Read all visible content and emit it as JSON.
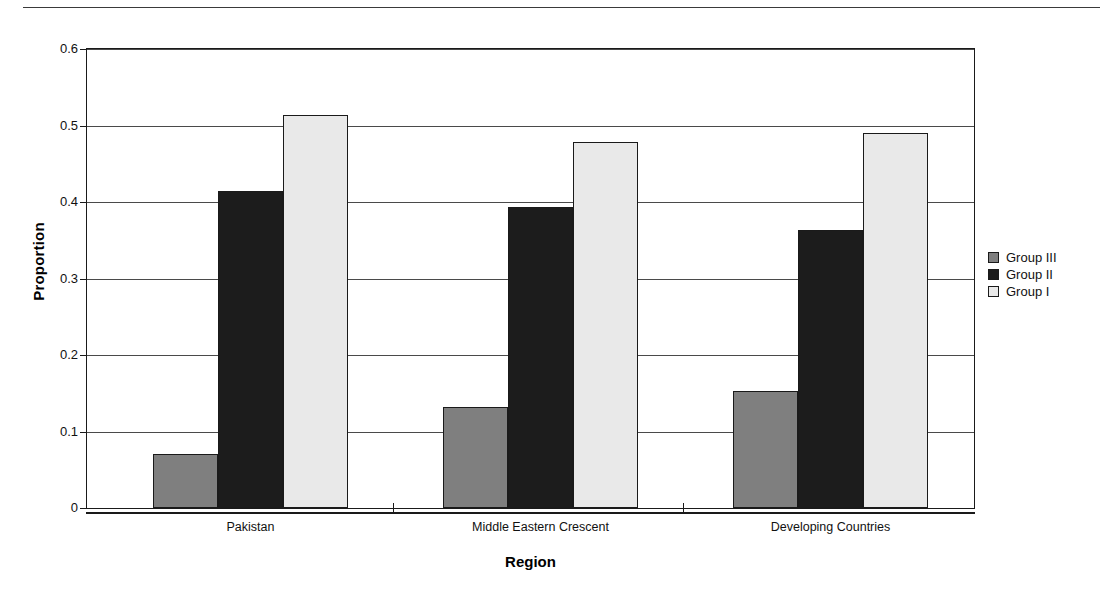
{
  "figure": {
    "top_rule": true
  },
  "chart_data": {
    "type": "bar",
    "title": "",
    "xlabel": "Region",
    "ylabel": "Proportion",
    "categories": [
      "Pakistan",
      "Middle Eastern Crescent",
      "Developing Countries"
    ],
    "series": [
      {
        "name": "Group III",
        "color": "#7f7f7f",
        "values": [
          0.07,
          0.132,
          0.153
        ]
      },
      {
        "name": "Group II",
        "color": "#1c1c1c",
        "values": [
          0.415,
          0.394,
          0.363
        ]
      },
      {
        "name": "Group I",
        "color": "#e9e9e9",
        "values": [
          0.514,
          0.479,
          0.49
        ]
      }
    ],
    "ylim": [
      0,
      0.6
    ],
    "yticks": [
      0,
      0.1,
      0.2,
      0.3,
      0.4,
      0.5,
      0.6
    ],
    "ytick_labels": [
      "0",
      "0.1",
      "0.2",
      "0.3",
      "0.4",
      "0.5",
      "0.6"
    ],
    "grid": "horizontal",
    "legend_position": "right",
    "legend_entries": [
      "Group III",
      "Group II",
      "Group I"
    ],
    "bar_grouping": "clustered-contiguous"
  }
}
